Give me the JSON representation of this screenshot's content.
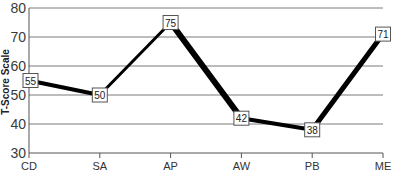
{
  "chart_data": {
    "type": "line",
    "title": "",
    "xlabel": "",
    "ylabel": "T-Score Scale",
    "categories": [
      "CD",
      "SA",
      "AP",
      "AW",
      "PB",
      "ME"
    ],
    "series": [
      {
        "name": "T-Score",
        "values": [
          55,
          50,
          75,
          42,
          38,
          71
        ]
      }
    ],
    "ylim": [
      30,
      80
    ],
    "yticks": [
      30,
      40,
      50,
      60,
      70,
      80
    ],
    "grid": true,
    "legend": "none",
    "data_labels": true,
    "colors": {
      "line": "#000000",
      "grid": "#7a7a7a",
      "axis": "#555555",
      "label_box_border": "#555555"
    }
  }
}
